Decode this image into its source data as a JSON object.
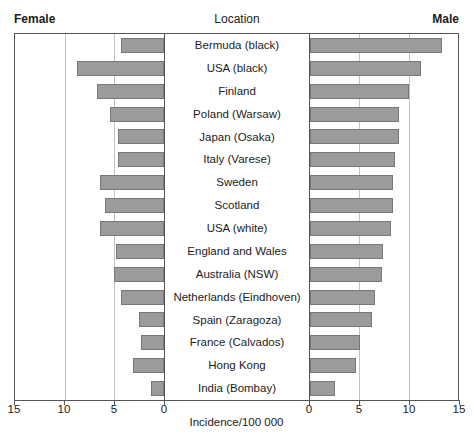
{
  "header": {
    "left": "Female",
    "center": "Location",
    "right": "Male"
  },
  "axis": {
    "title": "Incidence/100 000",
    "left_ticks": [
      "15",
      "10",
      "5",
      "0"
    ],
    "right_ticks": [
      "0",
      "5",
      "10",
      "15"
    ]
  },
  "colors": {
    "bar_fill": "#9b9b9b",
    "bar_border": "#787878",
    "panel_border": "#555555",
    "gridline": "#c2c2c2",
    "text": "#1c1c1c"
  },
  "chart_data": {
    "type": "bar",
    "orientation": "bilateral-horizontal",
    "title": "Location",
    "xlabel": "Incidence/100 000",
    "axis_max": 15,
    "tick_step": 5,
    "grid": true,
    "legend_position": "none",
    "categories": [
      "Bermuda (black)",
      "USA (black)",
      "Finland",
      "Poland (Warsaw)",
      "Japan (Osaka)",
      "Italy (Varese)",
      "Sweden",
      "Scotland",
      "USA (white)",
      "England and Wales",
      "Australia (NSW)",
      "Netherlands (Eindhoven)",
      "Spain (Zaragoza)",
      "France (Calvados)",
      "Hong Kong",
      "India (Bombay)"
    ],
    "series": [
      {
        "name": "Female",
        "side": "left",
        "values": [
          4.3,
          8.8,
          6.7,
          5.4,
          4.6,
          4.6,
          6.4,
          5.9,
          6.4,
          4.8,
          5.0,
          4.3,
          2.5,
          2.3,
          3.1,
          1.3
        ]
      },
      {
        "name": "Male",
        "side": "right",
        "values": [
          13.4,
          11.3,
          10.0,
          9.0,
          9.0,
          8.6,
          8.4,
          8.4,
          8.2,
          7.4,
          7.3,
          6.6,
          6.3,
          5.1,
          4.7,
          2.5
        ]
      }
    ],
    "xlim_left": [
      15,
      0
    ],
    "xlim_right": [
      0,
      15
    ]
  }
}
